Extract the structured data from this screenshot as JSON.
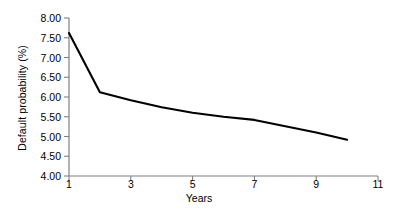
{
  "chart_data": {
    "type": "line",
    "title": "",
    "xlabel": "Years",
    "ylabel": "Default probability (%)",
    "xlim": [
      1,
      11
    ],
    "ylim": [
      4.0,
      8.0
    ],
    "grid": false,
    "legend": null,
    "xticks": [
      1,
      3,
      5,
      7,
      9,
      11
    ],
    "xtick_labels": [
      "1",
      "3",
      "5",
      "7",
      "9",
      "11"
    ],
    "yticks": [
      4.0,
      4.5,
      5.0,
      5.5,
      6.0,
      6.5,
      7.0,
      7.5,
      8.0
    ],
    "ytick_labels": [
      "4.00",
      "4.50",
      "5.00",
      "5.50",
      "6.00",
      "6.50",
      "7.00",
      "7.50",
      "8.00"
    ],
    "series": [
      {
        "name": "Default probability",
        "color": "#000000",
        "x": [
          1,
          2,
          3,
          4,
          5,
          6,
          7,
          8,
          9,
          10
        ],
        "values": [
          7.62,
          6.12,
          5.92,
          5.74,
          5.6,
          5.5,
          5.42,
          5.26,
          5.1,
          4.92
        ]
      }
    ]
  },
  "axes": {
    "axis_color": "#808080",
    "line_color": "#000000"
  }
}
